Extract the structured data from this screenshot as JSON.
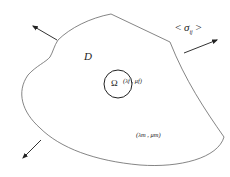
{
  "diagram": {
    "type": "inclusion-in-matrix",
    "colors": {
      "stroke": "#555555",
      "text": "#222222",
      "background": "#ffffff"
    },
    "domain_label": "D",
    "inclusion": {
      "symbol": "Ω",
      "properties": "(λ_f, μ_f)",
      "properties_display": "(λf , μf)"
    },
    "matrix": {
      "properties": "(λ_m, μ_m)",
      "properties_display": "(λm , μm)"
    },
    "far_field_stress": {
      "label": "< σ_ij >",
      "open": "<",
      "symbol": "σ",
      "subscript": "ij",
      "close": ">"
    },
    "arrows": [
      {
        "name": "traction-arrow-top-left",
        "direction": "up-left"
      },
      {
        "name": "traction-arrow-top-right",
        "direction": "up-right"
      },
      {
        "name": "traction-arrow-bottom-left",
        "direction": "down-left"
      }
    ]
  }
}
